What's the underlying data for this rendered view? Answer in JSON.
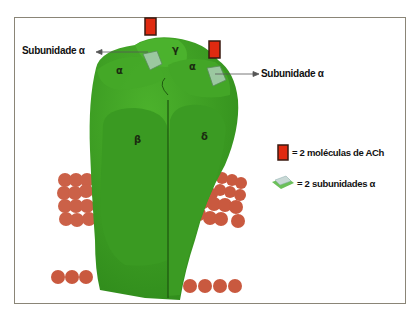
{
  "diagram": {
    "title": "",
    "colors": {
      "protein": "#3a9a22",
      "protein_dark": "#256e15",
      "lipid_head": "#c9593f",
      "ach": "#e02a10",
      "frame": "#8a8577"
    },
    "callouts": {
      "left": "Subunidade α",
      "right": "Subunidade α"
    },
    "subunits": {
      "alpha_left": "α",
      "gamma": "γ",
      "alpha_right": "α",
      "beta": "β",
      "delta": "δ"
    },
    "legend": [
      {
        "icon": "ach-molecule-icon",
        "text": "= 2 moléculas de ACh"
      },
      {
        "icon": "alpha-subunit-site-icon",
        "text": "= 2 subunidades α"
      }
    ]
  }
}
